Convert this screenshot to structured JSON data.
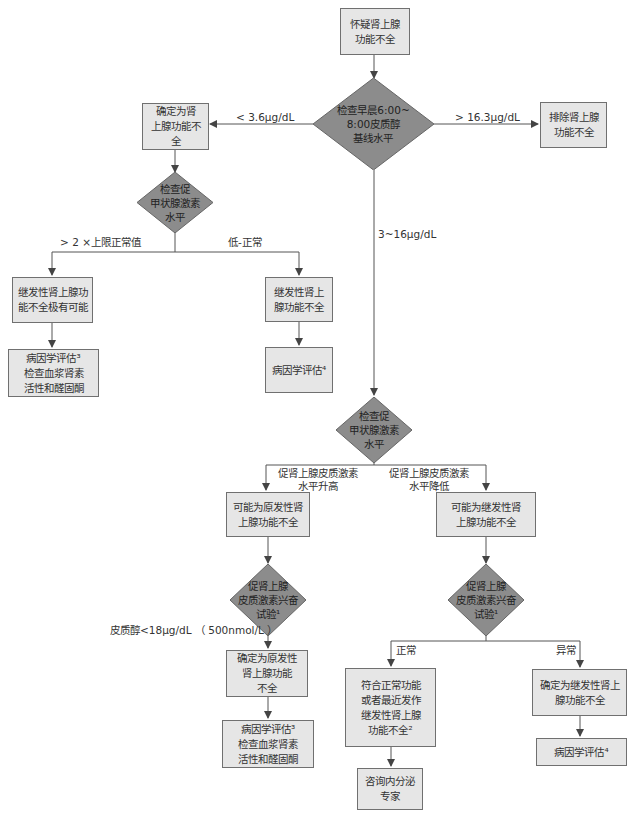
{
  "nodes": {
    "start": "怀疑肾上腺\n功能不全",
    "d_cortisol": "检查早晨6:00~\n8:00皮质醇\n基线水平",
    "confirm_ai": "确定为肾\n上腺功能不全",
    "exclude_ai": "排除肾上腺\n功能不全",
    "d_hormone_left": "检查促\n甲状腺激素\n水平",
    "secondary_likely": "继发性肾上腺功\n能不全极有可能",
    "etiology3_left": "病因学评估³\n检查血浆肾素\n活性和醛固酮",
    "secondary_mid": "继发性肾上\n腺功能不全",
    "etiology4_mid": "病因学评估⁴",
    "d_hormone_center": "检查促\n甲状腺激素\n水平",
    "possible_primary": "可能为原发性肾\n上腺功能不全",
    "possible_secondary": "可能为继发性肾\n上腺功能不全",
    "d_stim_left": "促肾上腺\n皮质激素兴奋\n试验¹",
    "d_stim_right": "促肾上腺\n皮质激素兴奋\n试验¹",
    "confirm_primary": "确定为原发性\n肾上腺功能\n不全",
    "etiology3_bottom": "病因学评估³\n检查血浆肾素\n活性和醛固酮",
    "normal_or_recent": "符合正常功能\n或者最近发作\n继发性肾上腺\n功能不全²",
    "consult": "咨询内分泌\n专家",
    "confirm_secondary": "确定为继发性肾上\n腺功能不全",
    "etiology4_right": "病因学评估⁴"
  },
  "edge_labels": {
    "lt36": "< 3.6μg/dL",
    "gt163": "> 16.3μg/dL",
    "range": "3~16μg/dL",
    "gt2x": "> 2 ×上限正常值",
    "low_normal": "低-正常",
    "acth_high": "促肾上腺皮质激素\n水平升高",
    "acth_low": "促肾上腺皮质激素\n水平降低",
    "cortisol_lt18": "皮质醇<18μg/dL （ 500nmol/L ）",
    "normal": "正常",
    "abnormal": "异常"
  },
  "colors": {
    "box_fill": "#e6e6e6",
    "diamond_fill": "#8c8c8c",
    "line": "#555555"
  }
}
